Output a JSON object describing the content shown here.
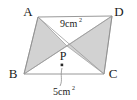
{
  "figure": {
    "background_color": "#ffffff",
    "outline_color": "#8d8d8d",
    "shade_color": "#d2d2d2",
    "text_color": "#1a1a1a",
    "vertices": [
      {
        "name": "A",
        "label": "A",
        "x": 38,
        "y": 17,
        "label_x": 28,
        "label_y": 16
      },
      {
        "name": "D",
        "label": "D",
        "x": 112,
        "y": 16,
        "label_x": 117,
        "label_y": 16
      },
      {
        "name": "B",
        "label": "B",
        "x": 24,
        "y": 74,
        "label_x": 12,
        "label_y": 77
      },
      {
        "name": "C",
        "label": "C",
        "x": 104,
        "y": 74,
        "label_x": 110,
        "label_y": 77
      }
    ],
    "intersection_point": {
      "name": "P",
      "label": "P",
      "x": 67,
      "y": 46,
      "label_x": 62,
      "label_y": 60
    },
    "marker_dot": {
      "x": 62,
      "y": 65
    },
    "shaded_triangles": [
      {
        "name": "triangle-ABP",
        "points": "38,17 24,74 67,46"
      },
      {
        "name": "triangle-PDC",
        "points": "67,46 112,16 104,74"
      }
    ],
    "edges": [
      {
        "name": "edge-AD",
        "from": "A",
        "to": "D"
      },
      {
        "name": "edge-BC",
        "from": "B",
        "to": "C"
      },
      {
        "name": "edge-AB",
        "from": "A",
        "to": "B"
      },
      {
        "name": "edge-DC",
        "from": "D",
        "to": "C"
      },
      {
        "name": "diagonal-AC",
        "from": "A",
        "to": "C"
      },
      {
        "name": "diagonal-BD",
        "from": "B",
        "to": "D"
      }
    ],
    "labels": {
      "top_area": {
        "text": "9cm",
        "superscript": "2",
        "full": "9cm2",
        "x": 68,
        "y": 26
      },
      "bottom_area": {
        "text": "5cm",
        "superscript": "2",
        "full": "5cm2",
        "x": 62,
        "y": 92
      }
    },
    "leader_line": {
      "path": "M 62,68 C 60,76 63,80 60,86"
    }
  }
}
